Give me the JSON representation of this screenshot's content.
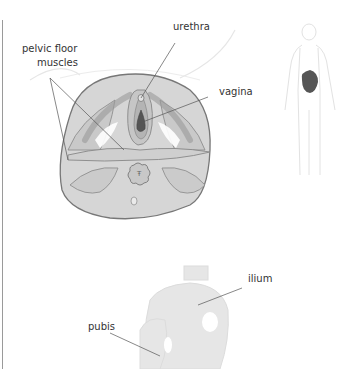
{
  "diagram": {
    "top_panel": {
      "labels": {
        "pelvic_floor_line1": "pelvic floor",
        "pelvic_floor_line2": "muscles",
        "urethra": "urethra",
        "vagina": "vagina"
      },
      "locator_highlight": "pelvis"
    },
    "bottom_panel": {
      "labels": {
        "ilium": "ilium",
        "pubis": "pubis"
      }
    },
    "colors": {
      "muscle_fill": "#d6d6d6",
      "outline": "#7a7a7a",
      "dark_highlight": "#555555",
      "bone_fill": "#e6e6e6",
      "leader_line": "#555555",
      "figure_outline": "#e4e4e4"
    }
  }
}
